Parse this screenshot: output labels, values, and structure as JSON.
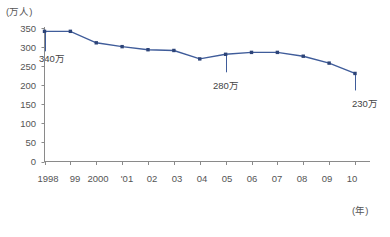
{
  "chart_data": {
    "type": "line",
    "title": "",
    "subtitle": "",
    "xlabel": "(年)",
    "ylabel": "(万人)",
    "x": [
      1998,
      1999,
      2000,
      2001,
      2002,
      2003,
      2004,
      2005,
      2006,
      2007,
      2008,
      2009,
      2010
    ],
    "categories": [
      "1998",
      "99",
      "2000",
      "'01",
      "02",
      "03",
      "04",
      "05",
      "06",
      "07",
      "08",
      "09",
      "10"
    ],
    "values": [
      340,
      340,
      310,
      300,
      292,
      290,
      268,
      280,
      285,
      285,
      275,
      257,
      230
    ],
    "series": [
      {
        "name": "人数",
        "values": [
          340,
          340,
          310,
          300,
          292,
          290,
          268,
          280,
          285,
          285,
          275,
          257,
          230
        ]
      }
    ],
    "ylim": [
      0,
      350
    ],
    "yticks": [
      0,
      50,
      100,
      150,
      200,
      250,
      300,
      350
    ],
    "ytick_labels": [
      "0",
      "50",
      "100",
      "150",
      "200",
      "250",
      "300",
      "350"
    ],
    "xlim": [
      1998,
      2010
    ],
    "grid": false,
    "legend": false,
    "legend_position": "none",
    "line_color": "#3f5c9a",
    "marker_color": "#2d4478",
    "marker": "square",
    "annotations": [
      {
        "label": "340万",
        "x": 1998,
        "y": 340
      },
      {
        "label": "280万",
        "x": 2005,
        "y": 280
      },
      {
        "label": "230万",
        "x": 2010,
        "y": 230
      }
    ]
  },
  "axis": {
    "y_unit": "(万人)",
    "x_unit": "(年)",
    "y_ticks": [
      {
        "label": "350"
      },
      {
        "label": "300"
      },
      {
        "label": "250"
      },
      {
        "label": "200"
      },
      {
        "label": "150"
      },
      {
        "label": "100"
      },
      {
        "label": "50"
      },
      {
        "label": "0"
      }
    ],
    "x_ticks": [
      {
        "label": "1998"
      },
      {
        "label": "99"
      },
      {
        "label": "2000"
      },
      {
        "label": "'01"
      },
      {
        "label": "02"
      },
      {
        "label": "03"
      },
      {
        "label": "04"
      },
      {
        "label": "05"
      },
      {
        "label": "06"
      },
      {
        "label": "07"
      },
      {
        "label": "08"
      },
      {
        "label": "09"
      },
      {
        "label": "10"
      }
    ]
  },
  "annotations": {
    "first": "340万",
    "middle": "280万",
    "last": "230万"
  },
  "colors": {
    "line": "#3f5c9a",
    "marker": "#2d4478",
    "axis": "#808080",
    "text": "#555555"
  }
}
